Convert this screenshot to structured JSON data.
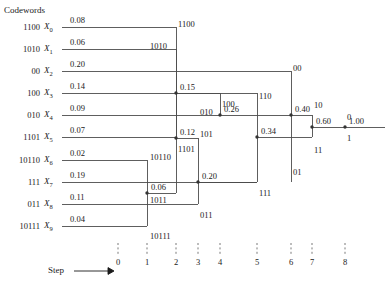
{
  "figure": {
    "header": "Codewords",
    "step_label": "Step",
    "final_value": "1.00"
  },
  "symbols": [
    {
      "codeword": "1100",
      "name": "X",
      "sub": "0",
      "prob": "0.08",
      "y": 27
    },
    {
      "codeword": "1010",
      "name": "X",
      "sub": "1",
      "prob": "0.06",
      "y": 49
    },
    {
      "codeword": "00",
      "name": "X",
      "sub": "2",
      "prob": "0.20",
      "y": 71
    },
    {
      "codeword": "100",
      "name": "X",
      "sub": "3",
      "prob": "0.14",
      "y": 93
    },
    {
      "codeword": "010",
      "name": "X",
      "sub": "4",
      "prob": "0.09",
      "y": 115
    },
    {
      "codeword": "1101",
      "name": "X",
      "sub": "5",
      "prob": "0.07",
      "y": 137
    },
    {
      "codeword": "10110",
      "name": "X",
      "sub": "6",
      "prob": "0.02",
      "y": 160
    },
    {
      "codeword": "111",
      "name": "X",
      "sub": "7",
      "prob": "0.19",
      "y": 182
    },
    {
      "codeword": "011",
      "name": "X",
      "sub": "8",
      "prob": "0.11",
      "y": 204
    },
    {
      "codeword": "10111",
      "name": "X",
      "sub": "9",
      "prob": "0.04",
      "y": 226
    }
  ],
  "merge_nodes": [
    {
      "id": "n006",
      "prob": "0.06",
      "x": 147,
      "y": 193
    },
    {
      "id": "n012",
      "prob": "0.12",
      "x": 176,
      "y": 138
    },
    {
      "id": "n015",
      "prob": "0.15",
      "x": 176,
      "y": 93
    },
    {
      "id": "n020",
      "prob": "0.20",
      "x": 198,
      "y": 182
    },
    {
      "id": "n026",
      "prob": "0.26",
      "x": 220,
      "y": 115
    },
    {
      "id": "n034",
      "prob": "0.34",
      "x": 257,
      "y": 137
    },
    {
      "id": "n040",
      "prob": "0.40",
      "x": 291,
      "y": 115
    },
    {
      "id": "n060",
      "prob": "0.60",
      "x": 312,
      "y": 127
    },
    {
      "id": "n100",
      "prob": "1.00",
      "x": 345,
      "y": 127
    }
  ],
  "branch_labels": [
    {
      "text": "1100",
      "x": 178,
      "y": 20
    },
    {
      "text": "1010",
      "x": 150,
      "y": 42
    },
    {
      "text": "1011",
      "x": 150,
      "y": 196
    },
    {
      "text": "10110",
      "x": 150,
      "y": 153
    },
    {
      "text": "10111",
      "x": 150,
      "y": 232
    },
    {
      "text": "1101",
      "x": 178,
      "y": 145
    },
    {
      "text": "010",
      "x": 200,
      "y": 108
    },
    {
      "text": "101",
      "x": 200,
      "y": 130
    },
    {
      "text": "100",
      "x": 222,
      "y": 100
    },
    {
      "text": "011",
      "x": 200,
      "y": 211
    },
    {
      "text": "111",
      "x": 259,
      "y": 189
    },
    {
      "text": "110",
      "x": 259,
      "y": 92
    },
    {
      "text": "00",
      "x": 293,
      "y": 64
    },
    {
      "text": "01",
      "x": 293,
      "y": 168
    },
    {
      "text": "10",
      "x": 314,
      "y": 101
    },
    {
      "text": "11",
      "x": 314,
      "y": 146
    },
    {
      "text": "0",
      "x": 347,
      "y": 113
    },
    {
      "text": "1",
      "x": 347,
      "y": 134
    }
  ],
  "axis": {
    "ticks": [
      {
        "label": "0",
        "x": 118
      },
      {
        "label": "1",
        "x": 147
      },
      {
        "label": "2",
        "x": 176
      },
      {
        "label": "3",
        "x": 198
      },
      {
        "label": "4",
        "x": 220
      },
      {
        "label": "5",
        "x": 257
      },
      {
        "label": "6",
        "x": 291
      },
      {
        "label": "7",
        "x": 312
      },
      {
        "label": "8",
        "x": 345
      }
    ]
  },
  "colors": {
    "line": "#4d4d4d",
    "text": "#1a1a1a",
    "background": "#ffffff"
  }
}
